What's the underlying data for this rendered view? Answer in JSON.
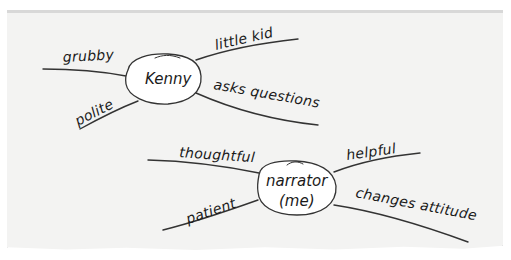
{
  "diagram": {
    "type": "character web / mind map",
    "maps": [
      {
        "id": "kenny",
        "center": "Kenny",
        "traits": [
          {
            "label": "grubby",
            "position": "upper-left"
          },
          {
            "label": "polite",
            "position": "lower-left"
          },
          {
            "label": "little kid",
            "position": "upper-right"
          },
          {
            "label": "asks questions",
            "position": "lower-right"
          }
        ]
      },
      {
        "id": "narrator",
        "center_line1": "narrator",
        "center_line2": "(me)",
        "traits": [
          {
            "label": "thoughtful",
            "position": "upper-left"
          },
          {
            "label": "patient",
            "position": "lower-left"
          },
          {
            "label": "helpful",
            "position": "upper-right"
          },
          {
            "label": "changes attitude",
            "position": "lower-right"
          }
        ]
      }
    ]
  },
  "colors": {
    "paper": "#f3f3f2",
    "ink": "#1a1a1a",
    "node_fill": "#ffffff"
  }
}
